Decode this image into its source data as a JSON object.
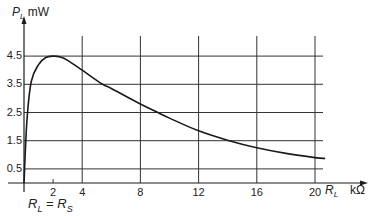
{
  "chart_data": {
    "type": "line",
    "title": "",
    "ylabel": "P_L mW",
    "ylabel_symbol": "P",
    "ylabel_sub": "L",
    "ylabel_unit": "mW",
    "xlabel": "R_L kΩ",
    "xlabel_symbol": "R",
    "xlabel_sub": "L",
    "xlabel_unit": "kΩ",
    "annotation": "R_L = R_S",
    "annotation_parts": {
      "r1": "R",
      "s1": "L",
      "eq": "=",
      "r2": "R",
      "s2": "S"
    },
    "xlim": [
      0,
      21.5
    ],
    "ylim": [
      0,
      5
    ],
    "grid": true,
    "x_ticks": [
      2,
      4,
      8,
      12,
      16,
      20
    ],
    "x_tick_labels": [
      "2",
      "4",
      "8",
      "12",
      "16",
      "20"
    ],
    "y_ticks": [
      0.5,
      1.5,
      2.5,
      3.5,
      4.5
    ],
    "y_tick_labels": [
      "0.5",
      "1.5",
      "2.5",
      "3.5",
      "4.5"
    ],
    "series": [
      {
        "name": "P_L",
        "x": [
          0,
          0.2,
          0.5,
          1.0,
          1.5,
          2.0,
          2.5,
          3.0,
          4.0,
          5.4,
          6.0,
          8.0,
          9.2,
          10.0,
          12.0,
          14.1,
          16.0,
          18.0,
          20.0,
          20.7
        ],
        "values": [
          0,
          2.2,
          3.6,
          4.2,
          4.45,
          4.5,
          4.47,
          4.35,
          4.0,
          3.5,
          3.35,
          2.8,
          2.5,
          2.3,
          1.85,
          1.5,
          1.25,
          1.05,
          0.9,
          0.87
        ]
      }
    ],
    "colors": {
      "line": "#1a1a1a",
      "grid": "#333333",
      "axis": "#1a1a1a"
    }
  }
}
